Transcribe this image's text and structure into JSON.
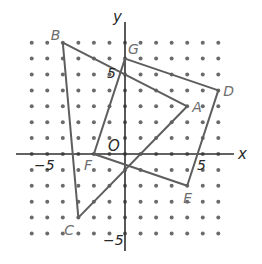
{
  "diagram": {
    "type": "coordinate-plane",
    "grid": {
      "x_min": -6,
      "x_max": 6,
      "y_min": -5,
      "y_max": 7,
      "style": "dots"
    },
    "axes": {
      "x_label": "x",
      "y_label": "y",
      "origin_label": "O",
      "x_ticks": [
        {
          "value": -5,
          "label": "−5"
        },
        {
          "value": 5,
          "label": "5"
        }
      ],
      "y_ticks": [
        {
          "value": 5,
          "label": "5"
        },
        {
          "value": -5,
          "label": "−5"
        }
      ]
    },
    "points": [
      {
        "name": "A",
        "x": 4,
        "y": 3
      },
      {
        "name": "B",
        "x": -4,
        "y": 7
      },
      {
        "name": "C",
        "x": -3,
        "y": -4
      },
      {
        "name": "D",
        "x": 6,
        "y": 4
      },
      {
        "name": "E",
        "x": 4,
        "y": -2
      },
      {
        "name": "F",
        "x": -2,
        "y": 0
      },
      {
        "name": "G",
        "x": 0,
        "y": 6
      }
    ],
    "polygons": [
      {
        "name": "triangle-ABC",
        "vertices": [
          "A",
          "B",
          "C"
        ]
      },
      {
        "name": "quadrilateral-DEFG",
        "vertices": [
          "G",
          "D",
          "E",
          "F"
        ]
      }
    ],
    "colors": {
      "dot": "#6b6b6b",
      "axis": "#2f2f2f",
      "polygon_stroke": "#5e5e5e",
      "point_label": "#6e6e6e"
    }
  }
}
